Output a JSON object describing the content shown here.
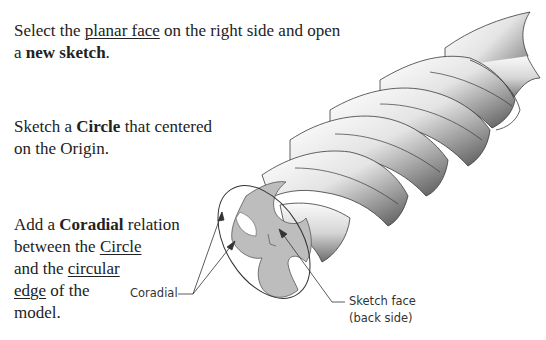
{
  "instructions": [
    {
      "id": "step-sketch-plane",
      "lines": [
        {
          "parts": [
            {
              "text": "Select the ",
              "style": "normal"
            },
            {
              "text": "planar face",
              "style": "underline"
            },
            {
              "text": " on the right side and open",
              "style": "normal"
            }
          ]
        },
        {
          "parts": [
            {
              "text": "a ",
              "style": "normal"
            },
            {
              "text": "new sketch",
              "style": "bold"
            },
            {
              "text": ".",
              "style": "normal"
            }
          ]
        }
      ]
    },
    {
      "id": "step-circle",
      "lines": [
        {
          "parts": [
            {
              "text": "Sketch a ",
              "style": "normal"
            },
            {
              "text": "Circle",
              "style": "bold"
            },
            {
              "text": " that centered",
              "style": "normal"
            }
          ]
        },
        {
          "parts": [
            {
              "text": "on the Origin.",
              "style": "normal"
            }
          ]
        }
      ]
    },
    {
      "id": "step-coradial",
      "lines": [
        {
          "parts": [
            {
              "text": "Add a ",
              "style": "normal"
            },
            {
              "text": "Coradial",
              "style": "bold"
            },
            {
              "text": " relation",
              "style": "normal"
            }
          ]
        },
        {
          "parts": [
            {
              "text": "between the ",
              "style": "normal"
            },
            {
              "text": "Circle",
              "style": "underline"
            }
          ]
        },
        {
          "parts": [
            {
              "text": "and the ",
              "style": "normal"
            },
            {
              "text": "circular",
              "style": "underline"
            }
          ]
        },
        {
          "parts": [
            {
              "text": "edge",
              "style": "underline"
            },
            {
              "text": " of the",
              "style": "normal"
            }
          ]
        },
        {
          "parts": [
            {
              "text": "model.",
              "style": "normal"
            }
          ]
        }
      ]
    }
  ],
  "callouts": {
    "coradial": "Coradial",
    "sketch_face_line1": "Sketch face",
    "sketch_face_line2": "(back side)"
  },
  "figure": {
    "face_fill": "#b9b9b9",
    "outline": "#333333"
  }
}
